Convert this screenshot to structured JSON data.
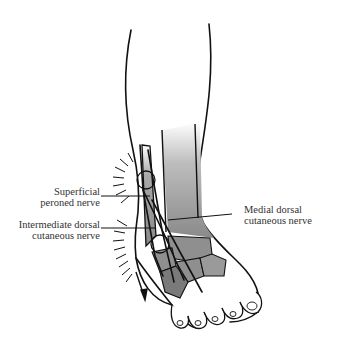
{
  "figure": {
    "colors": {
      "outline": "#111111",
      "bone_fill": "#8f8f8f",
      "bone_shadow": "#6f6f6f",
      "background": "#ffffff"
    }
  },
  "labels": {
    "superficial": {
      "line1": "Superficial",
      "line2": "peroned nerve"
    },
    "intermediate": {
      "line1": "Intermediate dorsal",
      "line2": "cutaneous nerve"
    },
    "medial": {
      "line1": "Medial dorsal",
      "line2": "cutaneous nerve"
    }
  }
}
